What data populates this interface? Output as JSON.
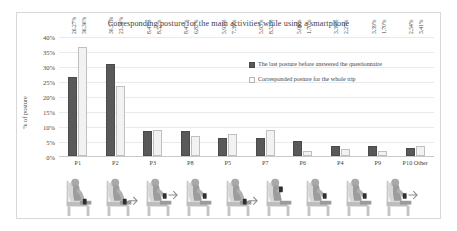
{
  "chart_data": {
    "type": "bar",
    "title": "Corresponding posture for the main activities while using a smartphone",
    "xlabel": "",
    "ylabel": "% of posture",
    "ylim": [
      0,
      40
    ],
    "ytick_labels": [
      "40%",
      "35%",
      "30%",
      "25%",
      "20%",
      "15%",
      "10%",
      "5%",
      "0%"
    ],
    "ytick_values": [
      40,
      35,
      30,
      25,
      20,
      15,
      10,
      5,
      0
    ],
    "grid": false,
    "legend_position": "upper right inside plot",
    "categories": [
      "P1",
      "P2",
      "P3",
      "P8",
      "P5",
      "P7",
      "P6",
      "P4",
      "P9",
      "P10 Other"
    ],
    "series": [
      {
        "name": "The last posture before answered the questionnaire",
        "color": "#595959",
        "values": [
          26.27,
          30.51,
          8.47,
          8.47,
          5.93,
          5.93,
          5.08,
          3.39,
          3.39,
          2.54
        ],
        "labels": [
          "26,27%",
          "30,51%",
          "8,47%",
          "8,47%",
          "5,93%",
          "5,93%",
          "5,08%",
          "3,39%",
          "3,39%",
          "2,54%"
        ]
      },
      {
        "name": "Corresponded posture for the whole trip",
        "color": "#f2f2f2",
        "values": [
          36.36,
          23.3,
          8.52,
          6.82,
          7.39,
          8.52,
          1.7,
          2.27,
          1.7,
          3.41
        ],
        "labels": [
          "36,36%",
          "23,30%",
          "8,52%",
          "6,82%",
          "7,39%",
          "8,52%",
          "1,70%",
          "2,27%",
          "1,70%",
          "3,41%"
        ]
      }
    ],
    "pictograms": [
      {
        "category": "P1",
        "name": "seated-posture-p1",
        "phone": "low-lap",
        "arrow": false
      },
      {
        "category": "P2",
        "name": "seated-posture-p2",
        "phone": "low-lap",
        "arrow": true
      },
      {
        "category": "P3",
        "name": "seated-posture-p3",
        "phone": "mid-chest",
        "arrow": true
      },
      {
        "category": "P8",
        "name": "seated-posture-p8",
        "phone": "mid-chest",
        "arrow": false
      },
      {
        "category": "P5",
        "name": "seated-posture-p5",
        "phone": "low-lap",
        "arrow": true
      },
      {
        "category": "P7",
        "name": "seated-posture-p7",
        "phone": "high-face",
        "arrow": false
      },
      {
        "category": "P6",
        "name": "seated-posture-p6",
        "phone": "mid-chest",
        "arrow": false
      },
      {
        "category": "P4",
        "name": "seated-posture-p4",
        "phone": "mid-chest",
        "arrow": false
      },
      {
        "category": "P9",
        "name": "seated-posture-p9",
        "phone": "mid-chest",
        "arrow": true
      },
      {
        "category": "P10 Other",
        "name": "seated-posture-none",
        "phone": "none",
        "arrow": false
      }
    ]
  }
}
